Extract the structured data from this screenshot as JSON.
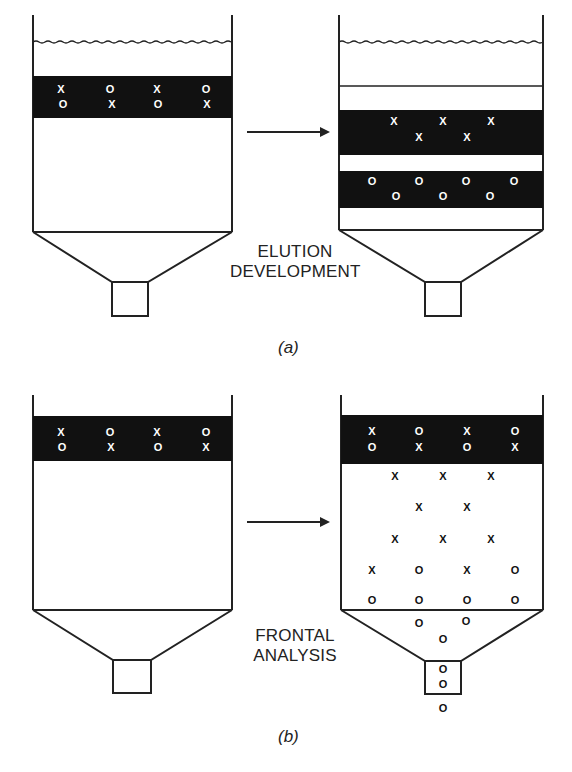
{
  "panels": {
    "a": {
      "caption": "(a)",
      "method_label_line1": "ELUTION",
      "method_label_line2": "DEVELOPMENT",
      "before": {
        "sample_band_rows": [
          [
            "X",
            "O",
            "X",
            "O"
          ],
          [
            "O",
            "X",
            "O",
            "X"
          ]
        ]
      },
      "after": {
        "band_x": {
          "row1": [
            "X",
            "X",
            "X"
          ],
          "row2": [
            "X",
            "X"
          ]
        },
        "band_o": {
          "row1": [
            "O",
            "O",
            "O",
            "O"
          ],
          "row2": [
            "O",
            "O",
            "O"
          ]
        }
      }
    },
    "b": {
      "caption": "(b)",
      "method_label_line1": "FRONTAL",
      "method_label_line2": "ANALYSIS",
      "before": {
        "sample_band_rows": [
          [
            "X",
            "O",
            "X",
            "O"
          ],
          [
            "O",
            "X",
            "O",
            "X"
          ]
        ]
      },
      "after": {
        "sample_band_rows": [
          [
            "X",
            "O",
            "X",
            "O"
          ],
          [
            "O",
            "X",
            "O",
            "X"
          ]
        ],
        "column_rows": [
          [
            "X",
            "X",
            "X"
          ],
          [
            "X",
            "X"
          ],
          [
            "X",
            "X",
            "X"
          ],
          [
            "X",
            "O",
            "X",
            "O"
          ],
          [
            "O",
            "O",
            "O",
            "O"
          ]
        ],
        "funnel_rows": [
          [
            "O",
            "O"
          ],
          [
            "O"
          ]
        ],
        "stem_rows": [
          [
            "O"
          ],
          [
            "O"
          ]
        ],
        "effluent": [
          "O"
        ]
      }
    }
  },
  "colors": {
    "band": "#111111",
    "line": "#222222",
    "marker_on_band": "#ffffff",
    "marker_on_white": "#111111"
  }
}
